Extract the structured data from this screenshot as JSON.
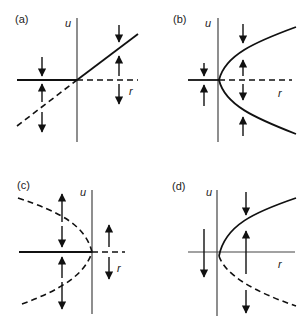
{
  "figure": {
    "panels": [
      {
        "id": "a",
        "label": "(a)",
        "type": "transcritical",
        "x_axis_label": "r",
        "y_axis_label": "u",
        "branches": [
          {
            "name": "u=0 (r<0)",
            "style": "solid",
            "stability": "stable"
          },
          {
            "name": "u=0 (r>0)",
            "style": "dashed",
            "stability": "unstable"
          },
          {
            "name": "u=r (r<0)",
            "style": "dashed",
            "stability": "unstable"
          },
          {
            "name": "u=r (r>0)",
            "style": "solid",
            "stability": "stable"
          }
        ]
      },
      {
        "id": "b",
        "label": "(b)",
        "type": "supercritical pitchfork",
        "x_axis_label": "r",
        "y_axis_label": "u",
        "branches": [
          {
            "name": "u=0 (r<0)",
            "style": "solid",
            "stability": "stable"
          },
          {
            "name": "u=0 (r>0)",
            "style": "dashed",
            "stability": "unstable"
          },
          {
            "name": "u=±sqrt(r)",
            "style": "solid",
            "stability": "stable"
          }
        ]
      },
      {
        "id": "c",
        "label": "(c)",
        "type": "subcritical pitchfork",
        "x_axis_label": "r",
        "y_axis_label": "u",
        "branches": [
          {
            "name": "u=0 (r<0)",
            "style": "solid",
            "stability": "stable"
          },
          {
            "name": "u=0 (r>0)",
            "style": "dashed",
            "stability": "unstable"
          },
          {
            "name": "u=±sqrt(-r)",
            "style": "dashed",
            "stability": "unstable"
          }
        ]
      },
      {
        "id": "d",
        "label": "(d)",
        "type": "saddle-node",
        "x_axis_label": "r",
        "y_axis_label": "u",
        "branches": [
          {
            "name": "u=+sqrt(r)",
            "style": "solid",
            "stability": "stable"
          },
          {
            "name": "u=-sqrt(r)",
            "style": "dashed",
            "stability": "unstable"
          }
        ]
      }
    ]
  },
  "labels": {
    "a": "(a)",
    "b": "(b)",
    "c": "(c)",
    "d": "(d)",
    "u": "u",
    "r": "r"
  }
}
